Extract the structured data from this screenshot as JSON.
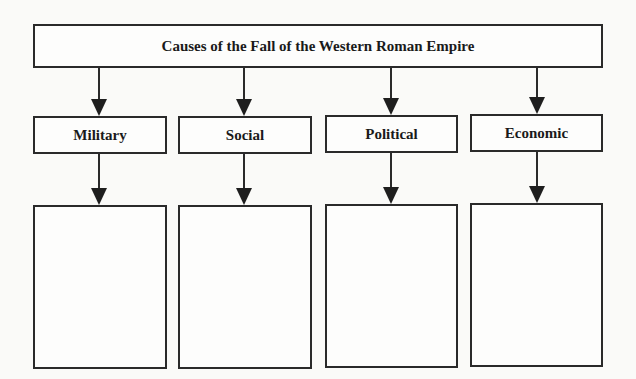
{
  "diagram": {
    "title": "Causes of the Fall of the Western Roman Empire",
    "categories": [
      {
        "label": "Military",
        "content": ""
      },
      {
        "label": "Social",
        "content": ""
      },
      {
        "label": "Political",
        "content": ""
      },
      {
        "label": "Economic",
        "content": ""
      }
    ],
    "colors": {
      "line": "#2a2a2a",
      "background": "#fafaf8"
    }
  }
}
